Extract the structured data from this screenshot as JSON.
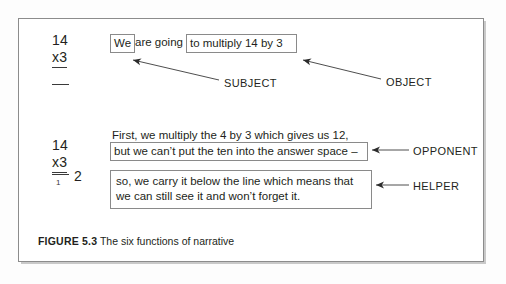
{
  "figure": {
    "caption_label": "FIGURE 5.3",
    "caption_text": "The six functions of narrative"
  },
  "sums": [
    {
      "name": "sum-top",
      "multiplicand": "14",
      "multiplier": "x3",
      "answer": "",
      "carry": ""
    },
    {
      "name": "sum-bottom",
      "multiplicand": "14",
      "multiplier": "x3",
      "answer": "2",
      "carry": "1"
    }
  ],
  "sentence_top": {
    "subject_clause": "We",
    "linking_clause": "are going",
    "object_clause": "to multiply 14 by 3"
  },
  "sentence_bottom": {
    "first_line": "First, we multiply the 4 by 3 which gives us 12,",
    "opponent_clause": "but we can’t put the ten into the answer space –",
    "helper_line_1": "so, we carry it below the line which means that",
    "helper_line_2": "we can still see it and won’t forget it."
  },
  "labels": {
    "subject": "SUBJECT",
    "object": "OBJECT",
    "opponent": "OPPONENT",
    "helper": "HELPER"
  },
  "colors": {
    "ink": "#231f20",
    "box_border": "#8a8a8a",
    "frame_border": "#8c8c8c",
    "arrow": "#3a3a3a",
    "page_background": "#ffffff"
  }
}
